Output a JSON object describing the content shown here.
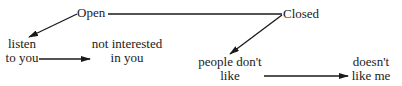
{
  "diagram": {
    "nodes": {
      "open": {
        "label": "Open"
      },
      "closed": {
        "label": "Closed"
      },
      "listen": {
        "line1": "listen",
        "line2": "to you"
      },
      "not_interested": {
        "line1": "not interested",
        "line2": "in you"
      },
      "people_dont_like": {
        "line1": "people don't",
        "line2": "like"
      },
      "doesnt_like_me": {
        "line1": "doesn't",
        "line2": "like me"
      }
    },
    "edges": [
      {
        "from": "open",
        "to": "closed",
        "type": "line"
      },
      {
        "from": "open",
        "to": "listen",
        "type": "arrow"
      },
      {
        "from": "listen",
        "to": "not_interested",
        "type": "arrow"
      },
      {
        "from": "closed",
        "to": "people_dont_like",
        "type": "arrow"
      },
      {
        "from": "people_dont_like",
        "to": "doesnt_like_me",
        "type": "arrow"
      }
    ],
    "colors": {
      "ink": "#1a1a1a",
      "background": "#ffffff"
    }
  }
}
